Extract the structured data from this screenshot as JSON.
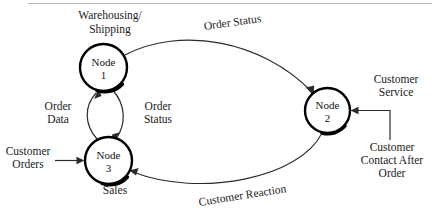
{
  "diagram": {
    "background_color": "#ffffff",
    "ink_color": "#1a1a1a",
    "nodes": [
      {
        "id": "node1",
        "name": "Node",
        "number": "1",
        "role_label": "Warehousing/",
        "role_label_line2": "Shipping",
        "cx": 103.5,
        "cy": 67.5,
        "r": 23.5
      },
      {
        "id": "node2",
        "name": "Node",
        "number": "2",
        "role_label": "Customer",
        "role_label_line2": "Service",
        "cx": 327.5,
        "cy": 110.5,
        "r": 22.5
      },
      {
        "id": "node3",
        "name": "Node",
        "number": "3",
        "role_label": "Sales",
        "role_label_line2": "",
        "cx": 108.5,
        "cy": 160.5,
        "r": 23.5
      }
    ],
    "edges": [
      {
        "id": "e1",
        "label": "Order Status",
        "from": "node1",
        "to": "node2",
        "style": "curved-arc-top"
      },
      {
        "id": "e2",
        "label": "Customer Reaction",
        "from": "node2",
        "to": "node3",
        "style": "curved-arc-bottom"
      },
      {
        "id": "e3",
        "label": "Order Data",
        "from": "node3",
        "to": "node1",
        "style": "bowed-left"
      },
      {
        "id": "e4",
        "label": "Order Status",
        "from": "node1",
        "to": "node3",
        "style": "bowed-right"
      }
    ],
    "external_inputs": [
      {
        "id": "in1",
        "label": "Customer",
        "label_line2": "Orders",
        "target": "node3"
      },
      {
        "id": "in2",
        "label": "Customer",
        "label_line2": "Contact After",
        "label_line3": "Order",
        "target": "node2"
      }
    ]
  }
}
